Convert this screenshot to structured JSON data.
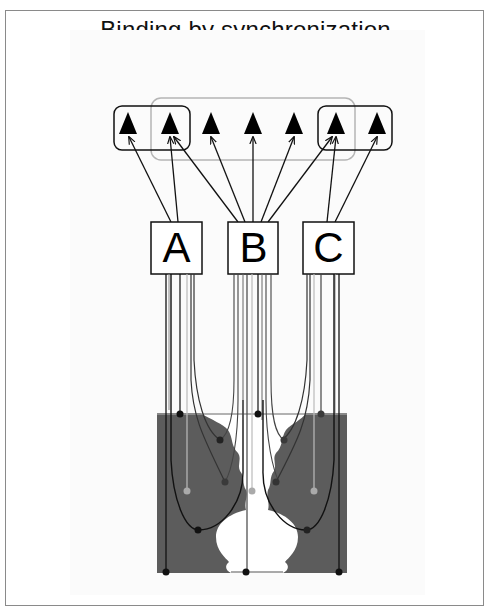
{
  "title": "Binding by synchronization",
  "labels": {
    "motor": [
      "motor",
      "code"
    ],
    "sensory": [
      "sensory",
      "code"
    ]
  },
  "sensory_units": [
    {
      "id": "A",
      "label": "A"
    },
    {
      "id": "B",
      "label": "B"
    },
    {
      "id": "C",
      "label": "C"
    }
  ],
  "motor_units": {
    "count": 7,
    "groupings": [
      {
        "name": "left-group",
        "members": [
          1,
          2
        ],
        "style": "black-rounded-box"
      },
      {
        "name": "middle-group",
        "members": [
          2,
          3,
          4,
          5,
          6
        ],
        "style": "gray-rounded-box"
      },
      {
        "name": "right-group",
        "members": [
          6,
          7
        ],
        "style": "black-rounded-box"
      }
    ]
  },
  "connections": [
    {
      "from": "A",
      "to": [
        1,
        2
      ]
    },
    {
      "from": "B",
      "to": [
        2,
        3,
        4,
        5,
        6
      ]
    },
    {
      "from": "C",
      "to": [
        6,
        7
      ]
    }
  ],
  "stimulus": {
    "name": "Rubin vase / faces figure",
    "figure_color": "#5a5a5a",
    "ground_color": "#ffffff"
  },
  "colors": {
    "line_dark": "#111111",
    "line_gray": "#999999",
    "panel": "#5c5c5c"
  }
}
